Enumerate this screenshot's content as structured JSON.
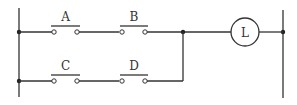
{
  "diagram": {
    "type": "ladder-logic",
    "rungs": [
      {
        "contacts": [
          {
            "label": "A",
            "type": "normally-open"
          },
          {
            "label": "B",
            "type": "normally-open"
          }
        ]
      },
      {
        "contacts": [
          {
            "label": "C",
            "type": "normally-open"
          },
          {
            "label": "D",
            "type": "normally-open"
          }
        ]
      }
    ],
    "output": {
      "label": "L",
      "type": "lamp"
    }
  }
}
